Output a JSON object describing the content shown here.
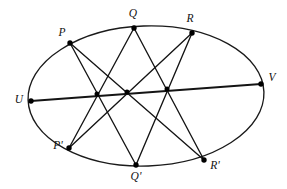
{
  "figure": {
    "background_color": "#ffffff",
    "stroke_color": "#141414",
    "dot_color": "#000000"
  },
  "chart_data": {
    "type": "scatter",
    "xlabel": "",
    "ylabel": "",
    "xlim": [
      0,
      287
    ],
    "ylim": [
      189,
      0
    ],
    "grid": false,
    "legend": "none",
    "conic": {
      "shape": "ellipse",
      "cx": 146,
      "cy": 96,
      "rx": 118,
      "ry": 70,
      "rotation_deg": -2
    },
    "points": [
      {
        "id": "P",
        "label": "P",
        "x": 70,
        "y": 43,
        "label_x": 62,
        "label_y": 33
      },
      {
        "id": "Q",
        "label": "Q",
        "x": 134,
        "y": 28,
        "label_x": 133,
        "label_y": 14
      },
      {
        "id": "R",
        "label": "R",
        "x": 192,
        "y": 33,
        "label_x": 190,
        "label_y": 19
      },
      {
        "id": "V",
        "label": "V",
        "x": 261,
        "y": 84,
        "label_x": 272,
        "label_y": 78
      },
      {
        "id": "U",
        "label": "U",
        "x": 31,
        "y": 101,
        "label_x": 19,
        "label_y": 100
      },
      {
        "id": "P2",
        "label": "P'",
        "x": 69,
        "y": 148,
        "label_x": 58,
        "label_y": 146
      },
      {
        "id": "Q2",
        "label": "Q'",
        "x": 136,
        "y": 165,
        "label_x": 136,
        "label_y": 177
      },
      {
        "id": "R2",
        "label": "R'",
        "x": 204,
        "y": 160,
        "label_x": 215,
        "label_y": 166
      }
    ],
    "chords": [
      {
        "name": "P-Q-prime",
        "from": "P",
        "to": "Q2"
      },
      {
        "name": "P-R-prime",
        "from": "P",
        "to": "R2"
      },
      {
        "name": "Q-P-prime",
        "from": "Q",
        "to": "P2"
      },
      {
        "name": "Q-R-prime",
        "from": "Q",
        "to": "R2"
      },
      {
        "name": "R-P-prime",
        "from": "R",
        "to": "P2"
      },
      {
        "name": "R-Q-prime",
        "from": "R",
        "to": "Q2"
      }
    ],
    "pascal_line": {
      "name": "U-V",
      "from": "U",
      "to": "V"
    },
    "intersections": [
      {
        "name": "X1",
        "x": 97,
        "y": 94
      },
      {
        "name": "X2",
        "x": 127,
        "y": 92
      },
      {
        "name": "X3",
        "x": 167,
        "y": 89
      }
    ],
    "labels": [
      "P",
      "Q",
      "R",
      "V",
      "U",
      "P'",
      "Q'",
      "R'"
    ],
    "annotations": []
  }
}
